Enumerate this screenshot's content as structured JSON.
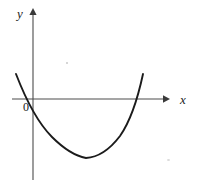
{
  "figure": {
    "kind": "cartesian-plot",
    "background_color": "#ffffff",
    "width": 199,
    "height": 185
  },
  "axes": {
    "x_axis": {
      "label": "x",
      "color": "#4c4c4c",
      "y_pixel": 99,
      "x_start_pixel": 12,
      "x_end_pixel": 170,
      "arrow": "right"
    },
    "y_axis": {
      "label": "y",
      "color": "#4c4c4c",
      "x_pixel": 33,
      "y_start_pixel": 11,
      "y_end_pixel": 180,
      "arrow": "up"
    },
    "origin": {
      "label": "0",
      "x_pixel": 33,
      "y_pixel": 99
    }
  },
  "chart_data": {
    "type": "line",
    "title": "",
    "xlabel": "x",
    "ylabel": "y",
    "grid": false,
    "legend": null,
    "series": [
      {
        "name": "parabola",
        "shape": "upward-opening parabola",
        "color": "#1b1b1b",
        "roots_pixel": [
          33,
          132
        ],
        "vertex_pixel": [
          86,
          158
        ],
        "left_end_pixel": [
          16,
          74
        ],
        "right_end_pixel": [
          143,
          74
        ],
        "path": "M 16 74 Q 33 118 52 137 Q 70 155 86 158 Q 104 157 120 136 Q 134 116 143 74"
      }
    ],
    "annotations": [
      {
        "text": "0",
        "x_pixel": 23,
        "y_pixel": 101
      },
      {
        "text": "x",
        "x_pixel": 180,
        "y_pixel": 93
      },
      {
        "text": "y",
        "x_pixel": 17,
        "y_pixel": 7
      }
    ]
  }
}
